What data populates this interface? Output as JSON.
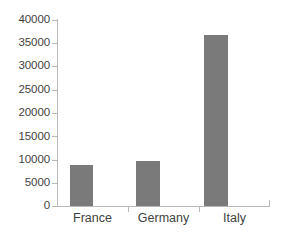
{
  "chart_data": {
    "type": "bar",
    "title": "",
    "subtitle": "",
    "xlabel": "",
    "ylabel": "",
    "categories": [
      "France",
      "Germany",
      "Italy"
    ],
    "values": [
      8800,
      9700,
      36700
    ],
    "series": [
      {
        "name": "",
        "values": [
          8800,
          9700,
          36700
        ]
      }
    ],
    "ylim": [
      0,
      40000
    ],
    "y_ticks": [
      0,
      5000,
      10000,
      15000,
      20000,
      25000,
      30000,
      35000,
      40000
    ],
    "y_tick_labels": [
      "0",
      "5000",
      "10000",
      "15000",
      "20000",
      "25000",
      "30000",
      "35000",
      "40000"
    ],
    "grid": false,
    "legend": false,
    "legend_position": "none",
    "bar_color": "#7a7a7a",
    "axis_color": "#b9b9b9",
    "text_color": "#3f3f3f",
    "background_color": "#ffffff"
  }
}
